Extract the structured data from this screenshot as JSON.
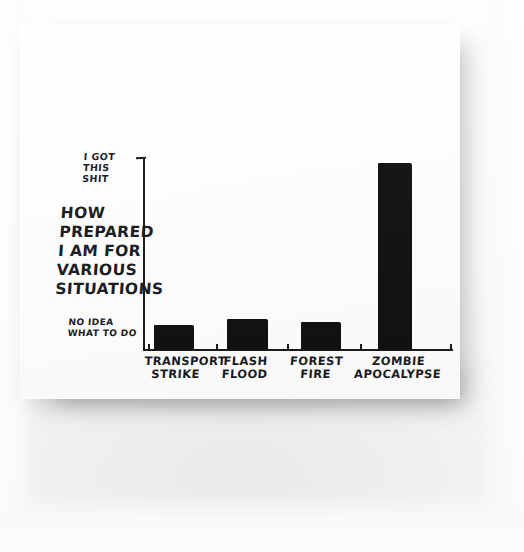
{
  "image": {
    "kind": "photograph-of-hand-drawn-chart",
    "surface_color": "#fdfdfd",
    "backdrop_color": "#f3f3f4",
    "ink_color": "#15161a"
  },
  "chart_data": {
    "type": "bar",
    "title": "",
    "xlabel": "",
    "ylabel": "HOW\nPREPARED\nI AM FOR\nVARIOUS\nSITUATIONS",
    "categories": [
      "TRANSPORT\nSTRIKE",
      "FLASH\nFLOOD",
      "FOREST\nFIRE",
      "ZOMBIE\nAPOCALYPSE"
    ],
    "values": [
      13,
      16,
      14.5,
      100
    ],
    "ylim": [
      0,
      104
    ],
    "y_axis_top_label": "I GOT\nTHIS\nSHIT",
    "y_axis_bottom_label": "NO IDEA\nWHAT TO DO",
    "y_tick_labels": [
      "NO IDEA\nWHAT TO DO",
      "I GOT\nTHIS\nSHIT"
    ],
    "grid": false,
    "legend": false,
    "bar_color": "#0d0d10",
    "axis_color": "#15161a"
  },
  "bars": [
    {
      "label": "TRANSPORT\nSTRIKE",
      "x": 134,
      "width": 40,
      "top": 301,
      "height": 25
    },
    {
      "label": "FLASH\nFLOOD",
      "x": 207,
      "width": 41,
      "top": 295,
      "height": 31
    },
    {
      "label": "FOREST\nFIRE",
      "x": 281,
      "width": 40,
      "top": 298,
      "height": 28
    },
    {
      "label": "ZOMBIE\nAPOCALYPSE",
      "x": 358,
      "width": 34,
      "top": 139,
      "height": 187
    }
  ],
  "x_ticks": [
    128,
    196,
    267,
    340,
    430
  ],
  "category_label_positions": [
    {
      "left": 124,
      "width": 64
    },
    {
      "left": 196,
      "width": 58
    },
    {
      "left": 266,
      "width": 60
    },
    {
      "left": 332,
      "width": 92
    }
  ]
}
